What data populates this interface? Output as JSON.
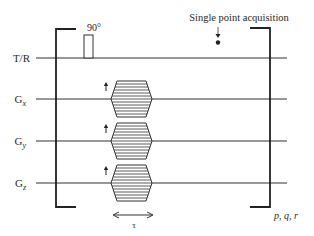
{
  "diagram": {
    "rf_pulse_label": "90°",
    "acquisition_label": "Single point acquisition",
    "loop_label": "p, q, r",
    "duration_label": "τ",
    "channels": [
      {
        "id": "tr",
        "label_main": "T/R",
        "label_sub": ""
      },
      {
        "id": "gx",
        "label_main": "G",
        "label_sub": "x"
      },
      {
        "id": "gy",
        "label_main": "G",
        "label_sub": "y"
      },
      {
        "id": "gz",
        "label_main": "G",
        "label_sub": "z"
      }
    ],
    "gradient_steps": 12,
    "line_color": "#333333"
  }
}
